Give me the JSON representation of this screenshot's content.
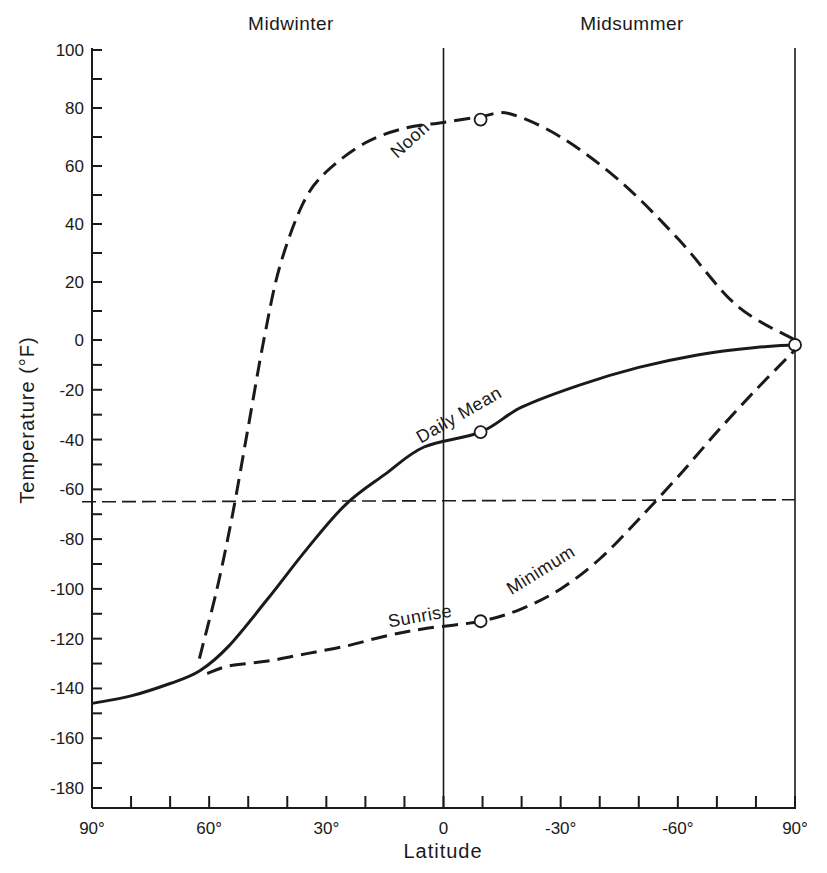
{
  "chart_data": {
    "type": "line",
    "title": "",
    "region_labels": [
      {
        "text": "Midwinter",
        "x_lat": 45
      },
      {
        "text": "Midsummer",
        "x_lat": -45
      }
    ],
    "xlabel": "Latitude",
    "ylabel": "Temperature (°F)",
    "x_axis": {
      "note": "Latitude runs from 90° (midwinter pole) through 0 to 90° (midsummer pole); summer hemisphere shown as negative",
      "range": [
        90,
        -90
      ],
      "tick_step": 10,
      "tick_labels": [
        {
          "value": 90,
          "label": "90°"
        },
        {
          "value": 60,
          "label": "60°"
        },
        {
          "value": 30,
          "label": "30°"
        },
        {
          "value": 0,
          "label": "0"
        },
        {
          "value": -30,
          "label": "-30°"
        },
        {
          "value": -60,
          "label": "-60°"
        },
        {
          "value": -90,
          "label": "90°"
        }
      ]
    },
    "y_axis": {
      "range": [
        -188,
        100
      ],
      "tick_step": 10,
      "tick_labels": [
        100,
        80,
        60,
        40,
        20,
        0,
        -20,
        -40,
        -60,
        -80,
        -100,
        -120,
        -140,
        -160,
        -180
      ]
    },
    "grid": false,
    "vertical_reference_lines": [
      0,
      -90
    ],
    "horizontal_reference_line": {
      "y": -65,
      "style": "dashed"
    },
    "series": [
      {
        "name": "Noon",
        "style": "dashed",
        "label_at": {
          "lat": 12,
          "temp": 70
        },
        "points": [
          [
            62.5,
            -128
          ],
          [
            58,
            -100
          ],
          [
            54,
            -70
          ],
          [
            50,
            -35
          ],
          [
            46,
            0
          ],
          [
            42,
            25
          ],
          [
            36,
            47
          ],
          [
            30,
            58
          ],
          [
            20,
            68
          ],
          [
            10,
            73
          ],
          [
            0,
            75
          ],
          [
            -9.5,
            77
          ],
          [
            -17,
            78
          ],
          [
            -30,
            70
          ],
          [
            -45,
            55
          ],
          [
            -60,
            35
          ],
          [
            -75,
            12
          ],
          [
            -90,
            0
          ]
        ],
        "markers": [
          [
            -9.5,
            76
          ]
        ]
      },
      {
        "name": "Daily Mean",
        "style": "solid",
        "label_at": {
          "lat": 6,
          "temp": -36
        },
        "points": [
          [
            90,
            -146
          ],
          [
            80,
            -143
          ],
          [
            70,
            -138
          ],
          [
            62.5,
            -133
          ],
          [
            55,
            -123
          ],
          [
            45,
            -104
          ],
          [
            35,
            -84
          ],
          [
            25,
            -66
          ],
          [
            15,
            -54
          ],
          [
            5,
            -43
          ],
          [
            -9.5,
            -37
          ],
          [
            -20,
            -27
          ],
          [
            -35,
            -18
          ],
          [
            -50,
            -11
          ],
          [
            -65,
            -6
          ],
          [
            -80,
            -3
          ],
          [
            -90,
            -2
          ]
        ],
        "markers": [
          [
            -9.5,
            -37
          ],
          [
            -90,
            -2
          ]
        ]
      },
      {
        "name": "Sunrise Minimum",
        "style": "dashed",
        "label_at": {
          "lat": -20,
          "temp": -100
        },
        "points": [
          [
            60.5,
            -134
          ],
          [
            55,
            -131
          ],
          [
            45,
            -129
          ],
          [
            35,
            -126
          ],
          [
            25,
            -123
          ],
          [
            15,
            -119
          ],
          [
            5,
            -116
          ],
          [
            -9.5,
            -113
          ],
          [
            -20,
            -108
          ],
          [
            -30,
            -100
          ],
          [
            -40,
            -88
          ],
          [
            -50,
            -72
          ],
          [
            -60,
            -55
          ],
          [
            -70,
            -37
          ],
          [
            -80,
            -20
          ],
          [
            -90,
            -4
          ]
        ],
        "markers": [
          [
            -9.5,
            -113
          ]
        ]
      }
    ]
  },
  "colors": {
    "ink": "#1a1a1a",
    "background": "#ffffff"
  }
}
